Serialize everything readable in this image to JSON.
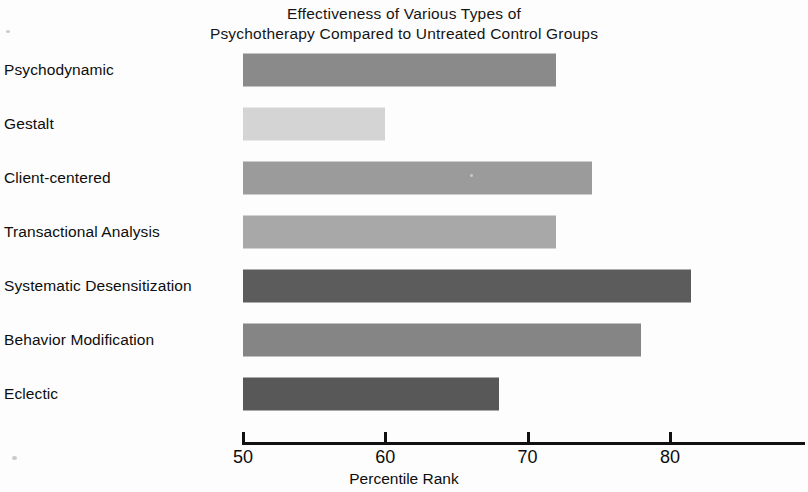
{
  "chart_data": {
    "type": "bar",
    "orientation": "horizontal",
    "title": "Effectiveness of Various Types of Psychotherapy Compared to Untreated Control Groups",
    "title_lines": [
      "Effectiveness of Various Types of",
      "Psychotherapy Compared to Untreated Control Groups"
    ],
    "xlabel": "Percentile Rank",
    "ylabel": "",
    "categories": [
      "Psychodynamic",
      "Gestalt",
      "Client-centered",
      "Transactional Analysis",
      "Systematic Desensitization",
      "Behavior Modification",
      "Eclectic"
    ],
    "values": [
      72,
      60,
      74.5,
      72,
      81.5,
      78,
      68
    ],
    "bar_colors": [
      "#8a8a8a",
      "#d4d4d4",
      "#9b9b9b",
      "#a8a8a8",
      "#5c5c5c",
      "#858585",
      "#585858"
    ],
    "xlim": [
      50,
      89.5
    ],
    "xticks": [
      50,
      60,
      70,
      80
    ],
    "xtick_labels": [
      "50",
      "60",
      "70",
      "80"
    ],
    "grid": false,
    "legend": false
  },
  "bars": [
    {
      "label": "Psychodynamic",
      "value": 72,
      "color": "#8a8a8a"
    },
    {
      "label": "Gestalt",
      "value": 60,
      "color": "#d4d4d4"
    },
    {
      "label": "Client-centered",
      "value": 74.5,
      "color": "#9b9b9b"
    },
    {
      "label": "Transactional Analysis",
      "value": 72,
      "color": "#a8a8a8"
    },
    {
      "label": "Systematic Desensitization",
      "value": 81.5,
      "color": "#5c5c5c"
    },
    {
      "label": "Behavior Modification",
      "value": 78,
      "color": "#858585"
    },
    {
      "label": "Eclectic",
      "value": 68,
      "color": "#585858"
    }
  ],
  "axis": {
    "ticks": [
      {
        "label": "50",
        "value": 50
      },
      {
        "label": "60",
        "value": 60
      },
      {
        "label": "70",
        "value": 70
      },
      {
        "label": "80",
        "value": 80
      }
    ],
    "title": "Percentile Rank"
  }
}
